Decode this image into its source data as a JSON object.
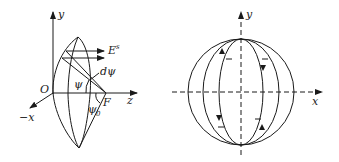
{
  "figures": [
    {
      "id": "paraboloid-feed",
      "description": "Paraboloid reflector with focal point F; rays from focus reflected parallel as E^s along z",
      "labels": {
        "y_axis": "y",
        "z_axis": "z",
        "x_axis": "−x",
        "origin": "O",
        "focus": "F",
        "field": "E",
        "field_sup": "s",
        "d_psi": "dψ",
        "psi": "ψ",
        "psi0": "ψ",
        "psi0_sub": "0"
      }
    },
    {
      "id": "aperture-field-lines",
      "description": "Aperture field distribution on circular aperture with curved field lines and arrows",
      "labels": {
        "y_axis": "y",
        "x_axis": "x"
      }
    }
  ],
  "colors": {
    "stroke": "#1a1a1a",
    "background": "#ffffff"
  }
}
